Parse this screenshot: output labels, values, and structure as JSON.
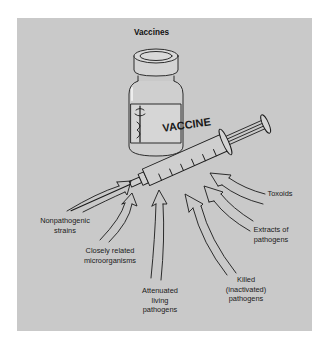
{
  "title": "Vaccines",
  "vial_label": "VACCINE",
  "colors": {
    "panel": "#c9c9c9",
    "ink": "#1a1a1a",
    "page": "#ffffff"
  },
  "sources": [
    {
      "id": "nonpathogenic",
      "label": "Nonpathogenic\nstrains"
    },
    {
      "id": "closely-related",
      "label": "Closely related\nmicroorganisms"
    },
    {
      "id": "attenuated",
      "label": "Attenuated\nliving\npathogens"
    },
    {
      "id": "killed",
      "label": "Killed\n(inactivated)\npathogens"
    },
    {
      "id": "extracts",
      "label": "Extracts of\npathogens"
    },
    {
      "id": "toxoids",
      "label": "Toxoids"
    }
  ]
}
